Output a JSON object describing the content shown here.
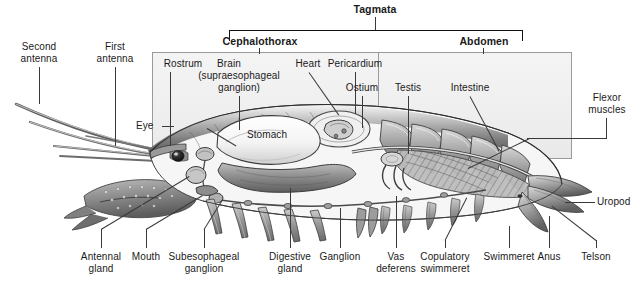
{
  "figure": {
    "tagmata_title": "Tagmata",
    "regions": [
      {
        "name": "Cephalothorax",
        "label": "Cephalothorax"
      },
      {
        "name": "Abdomen",
        "label": "Abdomen"
      }
    ],
    "inline_labels": [
      {
        "name": "eye",
        "label": "Eye"
      },
      {
        "name": "stomach",
        "label": "Stomach"
      },
      {
        "name": "uropod",
        "label": "Uropod"
      }
    ],
    "top_labels": [
      {
        "name": "second-antenna",
        "label": "Second\nantenna",
        "line1": "Second",
        "line2": "antenna"
      },
      {
        "name": "first-antenna",
        "label": "First\nantenna",
        "line1": "First",
        "line2": "antenna"
      },
      {
        "name": "rostrum",
        "label": "Rostrum",
        "line1": "Rostrum",
        "line2": ""
      },
      {
        "name": "brain",
        "label": "Brain (supraesophageal ganglion)",
        "line1": "Brain",
        "line2": "(supraesophageal",
        "line3": "ganglion)"
      },
      {
        "name": "heart",
        "label": "Heart",
        "line1": "Heart",
        "line2": ""
      },
      {
        "name": "pericardium",
        "label": "Pericardium",
        "line1": "Pericardium",
        "line2": ""
      },
      {
        "name": "ostium",
        "label": "Ostium",
        "line1": "Ostium",
        "line2": ""
      },
      {
        "name": "testis",
        "label": "Testis",
        "line1": "Testis",
        "line2": ""
      },
      {
        "name": "intestine",
        "label": "Intestine",
        "line1": "Intestine",
        "line2": ""
      },
      {
        "name": "flexor-muscles",
        "label": "Flexor muscles",
        "line1": "Flexor",
        "line2": "muscles"
      }
    ],
    "bottom_labels": [
      {
        "name": "antennal-gland",
        "label": "Antennal gland",
        "line1": "Antennal",
        "line2": "gland"
      },
      {
        "name": "mouth",
        "label": "Mouth",
        "line1": "Mouth",
        "line2": ""
      },
      {
        "name": "subesophageal-ganglion",
        "label": "Subesophageal ganglion",
        "line1": "Subesophageal",
        "line2": "ganglion"
      },
      {
        "name": "digestive-gland",
        "label": "Digestive gland",
        "line1": "Digestive",
        "line2": "gland"
      },
      {
        "name": "ganglion",
        "label": "Ganglion",
        "line1": "Ganglion",
        "line2": ""
      },
      {
        "name": "vas-deferens",
        "label": "Vas deferens",
        "line1": "Vas",
        "line2": "deferens"
      },
      {
        "name": "copulatory-swimmeret",
        "label": "Copulatory swimmeret",
        "line1": "Copulatory",
        "line2": "swimmeret"
      },
      {
        "name": "swimmeret",
        "label": "Swimmeret",
        "line1": "Swimmeret",
        "line2": ""
      },
      {
        "name": "anus",
        "label": "Anus",
        "line1": "Anus",
        "line2": ""
      },
      {
        "name": "telson",
        "label": "Telson",
        "line1": "Telson",
        "line2": ""
      }
    ],
    "colors": {
      "text": "#1a1a1a",
      "leader_line": "#3a3a3a",
      "panel_border": "#9a9a9a",
      "panel_fill": "#efefef",
      "bracket": "#111111",
      "background": "#ffffff"
    }
  }
}
